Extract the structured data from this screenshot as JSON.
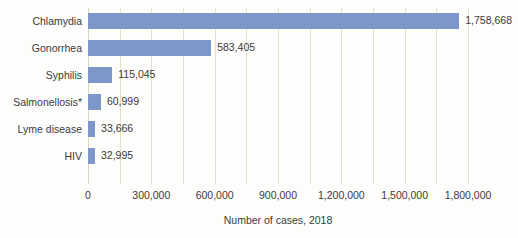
{
  "chart_data": {
    "type": "bar",
    "orientation": "horizontal",
    "title": "",
    "xlabel": "Number of cases, 2018",
    "ylabel": "",
    "categories": [
      "Chlamydia",
      "Gonorrhea",
      "Syphilis",
      "Salmonellosis*",
      "Lyme disease",
      "HIV"
    ],
    "values": [
      1758668,
      583405,
      115045,
      60999,
      33666,
      32995
    ],
    "value_labels": [
      "1,758,668",
      "583,405",
      "115,045",
      "60,999",
      "33,666",
      "32,995"
    ],
    "xlim": [
      0,
      1900000
    ],
    "xticks": [
      0,
      300000,
      600000,
      900000,
      1200000,
      1500000,
      1800000
    ],
    "xtick_labels": [
      "0",
      "300,000",
      "600,000",
      "900,000",
      "1,200,000",
      "1,500,000",
      "1,800,000"
    ],
    "minor_gridline_values": [
      150000,
      450000,
      750000,
      1050000,
      1350000,
      1650000
    ],
    "grid": true,
    "legend": null,
    "bar_color": "#7d97c9",
    "gridline_color": "#e6e1c4",
    "text_color": "#3b3b3b",
    "background_color": "#fdfdfb"
  }
}
